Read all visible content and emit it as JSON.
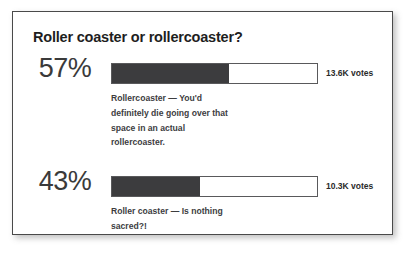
{
  "poll": {
    "title": "Roller coaster or rollercoaster?",
    "options": [
      {
        "percent_label": "57%",
        "description": "Rollercoaster — You'd definitely die going over that space in an actual rollercoaster.",
        "votes_label": "13.6K votes"
      },
      {
        "percent_label": "43%",
        "description": "Roller coaster — Is nothing sacred?!",
        "votes_label": "10.3K votes"
      }
    ]
  },
  "colors": {
    "bar_fill": "#3c3c3e",
    "bar_track": "#ffffff",
    "bar_border": "#59595b",
    "card_border": "#4a4a4a",
    "title_text": "#1e1e1e",
    "percent_text": "#3a3a3a",
    "body_text": "#3d3d3f"
  },
  "chart_data": {
    "type": "bar",
    "title": "Roller coaster or rollercoaster?",
    "categories": [
      "Rollercoaster — You'd definitely die going over that space in an actual rollercoaster.",
      "Roller coaster — Is nothing sacred?!"
    ],
    "values": [
      57,
      43
    ],
    "value_labels": [
      "57%",
      "43%"
    ],
    "counts": [
      13600,
      10300
    ],
    "count_labels": [
      "13.6K votes",
      "10.3K votes"
    ],
    "xlabel": "",
    "ylabel": "",
    "xlim": [
      0,
      100
    ],
    "unit": "percent",
    "orientation": "horizontal",
    "grid": false,
    "legend": false
  }
}
